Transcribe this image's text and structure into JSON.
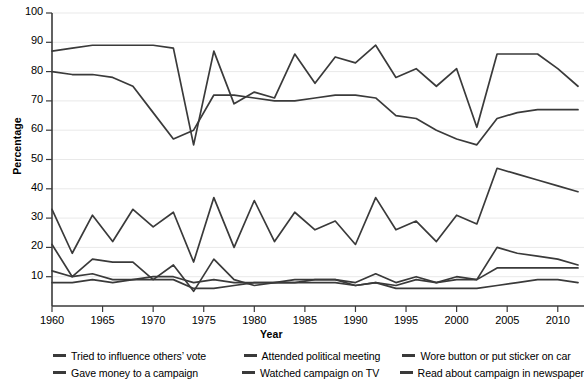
{
  "chart_data": {
    "type": "line",
    "title": "",
    "xlabel": "Year",
    "ylabel": "Percentage",
    "xlim": [
      1959,
      2013
    ],
    "ylim": [
      0,
      100
    ],
    "grid": true,
    "y_ticks": [
      0,
      10,
      20,
      30,
      40,
      50,
      60,
      70,
      80,
      90,
      100
    ],
    "y_tick_labels": [
      "",
      "10",
      "20",
      "30",
      "40",
      "50",
      "60",
      "70",
      "80",
      "90",
      "100"
    ],
    "x_ticks": [
      1960,
      1965,
      1970,
      1975,
      1980,
      1985,
      1990,
      1995,
      2000,
      2005,
      2010
    ],
    "x_tick_labels": [
      "1960",
      "1965",
      "1970",
      "1975",
      "1980",
      "1985",
      "1990",
      "1995",
      "2000",
      "2005",
      "2010"
    ],
    "legend_position": "bottom",
    "line_color": "#3a3a3a",
    "x": [
      1960,
      1962,
      1964,
      1966,
      1968,
      1970,
      1972,
      1974,
      1976,
      1978,
      1980,
      1982,
      1984,
      1986,
      1988,
      1990,
      1992,
      1994,
      1996,
      1998,
      2000,
      2002,
      2004,
      2006,
      2008,
      2010,
      2012
    ],
    "series": [
      {
        "name": "Watched campaign on TV",
        "values": [
          87,
          88,
          89,
          89,
          89,
          89,
          88,
          55,
          87,
          69,
          73,
          71,
          86,
          76,
          85,
          83,
          89,
          78,
          81,
          75,
          81,
          61,
          86,
          86,
          86,
          81,
          75
        ]
      },
      {
        "name": "Read about campaign in newspaper",
        "values": [
          80,
          79,
          79,
          78,
          75,
          66,
          57,
          60,
          72,
          72,
          71,
          70,
          70,
          71,
          72,
          72,
          71,
          65,
          64,
          60,
          57,
          55,
          64,
          66,
          67,
          67,
          67
        ]
      },
      {
        "name": "Tried to influence others' vote",
        "values": [
          33,
          18,
          31,
          22,
          33,
          27,
          32,
          15,
          37,
          20,
          36,
          22,
          32,
          26,
          29,
          21,
          37,
          26,
          29,
          22,
          31,
          28,
          47,
          45,
          43,
          41,
          39
        ]
      },
      {
        "name": "Wore button or put sticker on car",
        "values": [
          21,
          10,
          16,
          15,
          15,
          9,
          14,
          5,
          16,
          9,
          7,
          8,
          9,
          9,
          9,
          8,
          11,
          8,
          10,
          8,
          10,
          9,
          20,
          18,
          17,
          16,
          14
        ]
      },
      {
        "name": "Gave money to a campaign",
        "values": [
          12,
          10,
          11,
          9,
          9,
          10,
          10,
          8,
          9,
          8,
          8,
          8,
          8,
          9,
          9,
          7,
          8,
          7,
          9,
          8,
          9,
          9,
          13,
          13,
          13,
          13,
          13
        ]
      },
      {
        "name": "Attended political meeting",
        "values": [
          8,
          8,
          9,
          8,
          9,
          9,
          9,
          6,
          6,
          7,
          8,
          8,
          8,
          8,
          8,
          7,
          8,
          6,
          6,
          6,
          6,
          6,
          7,
          8,
          9,
          9,
          8
        ]
      }
    ]
  },
  "legend": {
    "rows": [
      [
        {
          "label": "Tried to influence others’ vote"
        },
        {
          "label": "Attended political meeting"
        },
        {
          "label": "Wore button or put sticker on car"
        }
      ],
      [
        {
          "label": "Gave money to a campaign"
        },
        {
          "label": "Watched campaign on TV"
        },
        {
          "label": "Read about campaign in newspaper"
        }
      ]
    ]
  }
}
